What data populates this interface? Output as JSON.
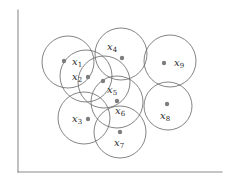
{
  "figure": {
    "name": "epsilon-neighborhood-point-diagram",
    "background_color": "#ffffff",
    "axis_color": "#8c8c8c",
    "circle_stroke_color": "#6e6e6e",
    "dot_color": "#7d7d7d",
    "label_color": "#2b2b2b"
  },
  "axes": {
    "y_axis": {
      "x": 18,
      "y_top": 10,
      "y_bottom": 172
    },
    "x_axis": {
      "y": 172,
      "x_left": 18,
      "x_right": 222
    }
  },
  "chart_data": {
    "type": "scatter",
    "title": "",
    "xlabel": "",
    "ylabel": "",
    "grid": false,
    "legend": null,
    "annotations": [],
    "points": [
      {
        "label": "x",
        "subscript": "1",
        "cx": 68,
        "cy": 62,
        "r": 26,
        "label_x": 72,
        "label_y": 65,
        "dot_x": 64,
        "dot_y": 61
      },
      {
        "label": "x",
        "subscript": "2",
        "cx": 86,
        "cy": 76,
        "r": 26,
        "label_x": 72,
        "label_y": 80,
        "dot_x": 88,
        "dot_y": 77
      },
      {
        "label": "x",
        "subscript": "3",
        "cx": 84,
        "cy": 118,
        "r": 26,
        "label_x": 72,
        "label_y": 122,
        "dot_x": 88,
        "dot_y": 119
      },
      {
        "label": "x",
        "subscript": "4",
        "cx": 121,
        "cy": 54,
        "r": 26,
        "label_x": 107,
        "label_y": 50,
        "dot_x": 122,
        "dot_y": 58
      },
      {
        "label": "x",
        "subscript": "5",
        "cx": 104,
        "cy": 82,
        "r": 26,
        "label_x": 107,
        "label_y": 93,
        "dot_x": 103,
        "dot_y": 81
      },
      {
        "label": "x",
        "subscript": "6",
        "cx": 117,
        "cy": 102,
        "r": 26,
        "label_x": 115,
        "label_y": 114,
        "dot_x": 117,
        "dot_y": 101
      },
      {
        "label": "x",
        "subscript": "7",
        "cx": 120,
        "cy": 132,
        "r": 26,
        "label_x": 114,
        "label_y": 146,
        "dot_x": 120,
        "dot_y": 132
      },
      {
        "label": "x",
        "subscript": "8",
        "cx": 168,
        "cy": 106,
        "r": 24,
        "label_x": 160,
        "label_y": 119,
        "dot_x": 167,
        "dot_y": 104
      },
      {
        "label": "x",
        "subscript": "9",
        "cx": 170,
        "cy": 61,
        "r": 26,
        "label_x": 174,
        "label_y": 66,
        "dot_x": 164,
        "dot_y": 63
      }
    ]
  }
}
